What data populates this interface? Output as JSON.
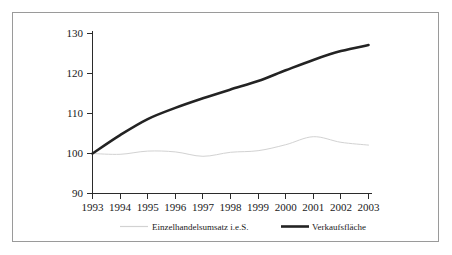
{
  "chart_data": {
    "type": "line",
    "title": "",
    "subtitle": "",
    "xlabel": "",
    "ylabel": "",
    "x": [
      1993,
      1994,
      1995,
      1996,
      1997,
      1998,
      1999,
      2000,
      2001,
      2002,
      2003
    ],
    "xtick_labels": [
      "1993",
      "1994",
      "1995",
      "1996",
      "1997",
      "1998",
      "1999",
      "2000",
      "2001",
      "2002",
      "2003"
    ],
    "ytick_labels": [
      "90",
      "100",
      "110",
      "120",
      "130"
    ],
    "yticks": [
      90,
      100,
      110,
      120,
      130
    ],
    "ylim": [
      90,
      130
    ],
    "xlim": [
      1993,
      2003
    ],
    "grid": false,
    "legend_position": "bottom",
    "series": [
      {
        "name": "Einzelhandelsumsatz i.e.S.",
        "color": "#d2d2d2",
        "line_width": "thin",
        "values": [
          100.0,
          99.8,
          100.6,
          100.4,
          99.3,
          100.3,
          100.7,
          102.2,
          104.2,
          102.8,
          102.1
        ]
      },
      {
        "name": "Verkaufsfläche",
        "color": "#232323",
        "line_width": "thick",
        "values": [
          100.0,
          104.6,
          108.6,
          111.4,
          113.8,
          116.0,
          118.1,
          120.8,
          123.4,
          125.6,
          127.1
        ]
      }
    ]
  },
  "legend": {
    "items": [
      {
        "label": "Einzelhandelsumsatz i.e.S."
      },
      {
        "label": "Verkaufsfläche"
      }
    ]
  },
  "axes": {
    "y_ticks": [
      {
        "label": "130"
      },
      {
        "label": "120"
      },
      {
        "label": "110"
      },
      {
        "label": "100"
      },
      {
        "label": "90"
      }
    ],
    "x_ticks": [
      {
        "label": "1993"
      },
      {
        "label": "1994"
      },
      {
        "label": "1995"
      },
      {
        "label": "1996"
      },
      {
        "label": "1997"
      },
      {
        "label": "1998"
      },
      {
        "label": "1999"
      },
      {
        "label": "2000"
      },
      {
        "label": "2001"
      },
      {
        "label": "2002"
      },
      {
        "label": "2003"
      }
    ]
  },
  "colors": {
    "frame_border": "#9a9a9a",
    "axis": "#2b2b2b",
    "series_sales": "#d2d2d2",
    "series_area": "#232323",
    "background": "#ffffff"
  }
}
